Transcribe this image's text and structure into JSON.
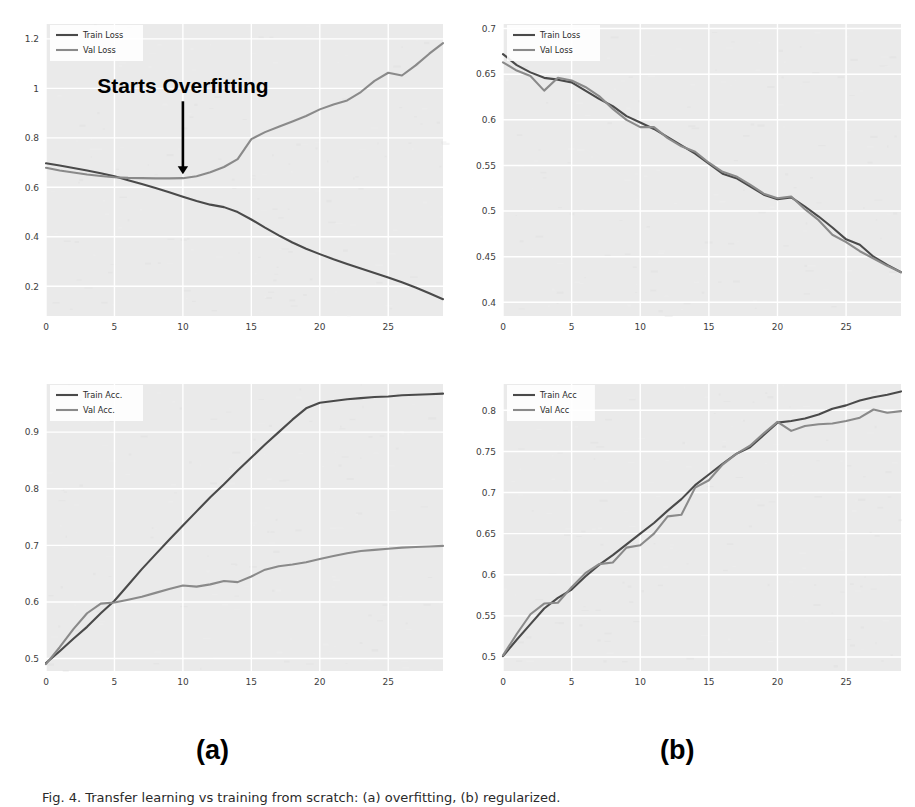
{
  "figure": {
    "panel_letters": [
      "(a)",
      "(b)"
    ],
    "caption": "Fig. 4. Transfer learning vs training from scratch: (a) overfitting, (b) regularized.",
    "colors": {
      "train": "#4a4a4a",
      "val": "#8a8a8a",
      "plot_background": "#eaeaea",
      "grid": "#ffffff",
      "text": "#2b2b2b",
      "annotation": "#000000"
    }
  },
  "chart_data": [
    {
      "id": "top-left",
      "type": "line",
      "title": "Train Loss: 0.110, Val Accuracy: 1.183",
      "xlabel": "",
      "ylabel": "",
      "xlim": [
        0,
        29
      ],
      "ylim": [
        0.08,
        1.26
      ],
      "xticks": [
        0,
        5,
        10,
        15,
        20,
        25
      ],
      "yticks": [
        0.2,
        0.4,
        0.6,
        0.8,
        1,
        1.2
      ],
      "ytick_labels": [
        "0.2",
        "0.4",
        "0.6",
        "0.8",
        "1",
        "1.2"
      ],
      "grid": true,
      "legend_position": "upper-left",
      "annotations": [
        {
          "text": "Starts Overfitting",
          "x": 10,
          "y": 0.98,
          "arrow_to_x": 10,
          "arrow_to_y": 0.645
        }
      ],
      "x": [
        0,
        1,
        2,
        3,
        4,
        5,
        6,
        7,
        8,
        9,
        10,
        11,
        12,
        13,
        14,
        15,
        16,
        17,
        18,
        19,
        20,
        21,
        22,
        23,
        24,
        25,
        26,
        27,
        28,
        29
      ],
      "series": [
        {
          "name": "Train Loss",
          "color": "#4a4a4a",
          "values": [
            0.697,
            0.688,
            0.678,
            0.668,
            0.657,
            0.645,
            0.629,
            0.613,
            0.597,
            0.58,
            0.562,
            0.545,
            0.53,
            0.52,
            0.5,
            0.47,
            0.437,
            0.406,
            0.377,
            0.352,
            0.33,
            0.309,
            0.29,
            0.272,
            0.254,
            0.236,
            0.216,
            0.195,
            0.172,
            0.148
          ]
        },
        {
          "name": "Val Loss",
          "color": "#8a8a8a",
          "values": [
            0.679,
            0.668,
            0.66,
            0.652,
            0.646,
            0.641,
            0.638,
            0.637,
            0.636,
            0.636,
            0.637,
            0.645,
            0.661,
            0.682,
            0.714,
            0.795,
            0.823,
            0.845,
            0.866,
            0.888,
            0.915,
            0.935,
            0.951,
            0.985,
            1.03,
            1.063,
            1.052,
            1.093,
            1.14,
            1.183
          ]
        }
      ]
    },
    {
      "id": "top-right",
      "type": "line",
      "title": "Train Loss: 0.398, Val Accuracy: 0.433",
      "xlabel": "",
      "ylabel": "",
      "xlim": [
        0,
        29
      ],
      "ylim": [
        0.385,
        0.705
      ],
      "xticks": [
        0,
        5,
        10,
        15,
        20,
        25
      ],
      "yticks": [
        0.4,
        0.45,
        0.5,
        0.55,
        0.6,
        0.65,
        0.7
      ],
      "ytick_labels": [
        "0.4",
        "0.45",
        "0.5",
        "0.55",
        "0.6",
        "0.65",
        "0.7"
      ],
      "grid": true,
      "legend_position": "upper-left",
      "annotations": [],
      "x": [
        0,
        1,
        2,
        3,
        4,
        5,
        6,
        7,
        8,
        9,
        10,
        11,
        12,
        13,
        14,
        15,
        16,
        17,
        18,
        19,
        20,
        21,
        22,
        23,
        24,
        25,
        26,
        27,
        28,
        29
      ],
      "series": [
        {
          "name": "Train Loss",
          "color": "#4a4a4a",
          "values": [
            0.672,
            0.66,
            0.652,
            0.646,
            0.644,
            0.641,
            0.632,
            0.623,
            0.615,
            0.604,
            0.597,
            0.59,
            0.581,
            0.572,
            0.563,
            0.552,
            0.541,
            0.536,
            0.527,
            0.518,
            0.513,
            0.515,
            0.505,
            0.494,
            0.482,
            0.469,
            0.463,
            0.45,
            0.441,
            0.433
          ]
        },
        {
          "name": "Val Loss",
          "color": "#8a8a8a",
          "values": [
            0.663,
            0.654,
            0.648,
            0.632,
            0.646,
            0.643,
            0.636,
            0.626,
            0.612,
            0.6,
            0.592,
            0.592,
            0.58,
            0.571,
            0.565,
            0.553,
            0.543,
            0.538,
            0.529,
            0.519,
            0.514,
            0.516,
            0.502,
            0.49,
            0.474,
            0.466,
            0.456,
            0.448,
            0.44,
            0.433
          ]
        }
      ]
    },
    {
      "id": "bottom-left",
      "type": "line",
      "title": "Train Accuracy: 0.968, Val Accuracy: 0.699",
      "xlabel": "",
      "ylabel": "",
      "xlim": [
        0,
        29
      ],
      "ylim": [
        0.478,
        0.985
      ],
      "xticks": [
        0,
        5,
        10,
        15,
        20,
        25
      ],
      "yticks": [
        0.5,
        0.6,
        0.7,
        0.8,
        0.9
      ],
      "ytick_labels": [
        "0.5",
        "0.6",
        "0.7",
        "0.8",
        "0.9"
      ],
      "grid": true,
      "legend_position": "upper-left",
      "annotations": [],
      "x": [
        0,
        1,
        2,
        3,
        4,
        5,
        6,
        7,
        8,
        9,
        10,
        11,
        12,
        13,
        14,
        15,
        16,
        17,
        18,
        19,
        20,
        21,
        22,
        23,
        24,
        25,
        26,
        27,
        28,
        29
      ],
      "series": [
        {
          "name": "Train Acc.",
          "color": "#4a4a4a",
          "values": [
            0.492,
            0.513,
            0.535,
            0.556,
            0.58,
            0.602,
            0.63,
            0.658,
            0.684,
            0.71,
            0.735,
            0.76,
            0.785,
            0.808,
            0.832,
            0.855,
            0.878,
            0.9,
            0.922,
            0.942,
            0.952,
            0.955,
            0.958,
            0.96,
            0.962,
            0.963,
            0.965,
            0.966,
            0.967,
            0.968
          ]
        },
        {
          "name": "Val Acc.",
          "color": "#8a8a8a",
          "values": [
            0.49,
            0.52,
            0.552,
            0.58,
            0.597,
            0.599,
            0.604,
            0.609,
            0.616,
            0.623,
            0.629,
            0.627,
            0.631,
            0.637,
            0.635,
            0.645,
            0.657,
            0.663,
            0.666,
            0.67,
            0.676,
            0.681,
            0.686,
            0.69,
            0.692,
            0.694,
            0.696,
            0.697,
            0.698,
            0.699
          ]
        }
      ]
    },
    {
      "id": "bottom-right",
      "type": "line",
      "title": "Train Accuracy: 0.823, Val Accuracy: 0.799",
      "xlabel": "",
      "ylabel": "",
      "xlim": [
        0,
        29
      ],
      "ylim": [
        0.483,
        0.832
      ],
      "xticks": [
        0,
        5,
        10,
        15,
        20,
        25
      ],
      "yticks": [
        0.5,
        0.55,
        0.6,
        0.65,
        0.7,
        0.75,
        0.8
      ],
      "ytick_labels": [
        "0.5",
        "0.55",
        "0.6",
        "0.65",
        "0.7",
        "0.75",
        "0.8"
      ],
      "grid": true,
      "legend_position": "upper-left",
      "annotations": [],
      "x": [
        0,
        1,
        2,
        3,
        4,
        5,
        6,
        7,
        8,
        9,
        10,
        11,
        12,
        13,
        14,
        15,
        16,
        17,
        18,
        19,
        20,
        21,
        22,
        23,
        24,
        25,
        26,
        27,
        28,
        29
      ],
      "series": [
        {
          "name": "Train Acc",
          "color": "#4a4a4a",
          "values": [
            0.501,
            0.521,
            0.54,
            0.559,
            0.572,
            0.582,
            0.598,
            0.612,
            0.624,
            0.637,
            0.65,
            0.663,
            0.678,
            0.692,
            0.709,
            0.722,
            0.735,
            0.747,
            0.755,
            0.77,
            0.785,
            0.787,
            0.79,
            0.795,
            0.802,
            0.806,
            0.812,
            0.816,
            0.819,
            0.823
          ]
        },
        {
          "name": "Val Acc",
          "color": "#8a8a8a",
          "values": [
            0.502,
            0.528,
            0.552,
            0.565,
            0.566,
            0.585,
            0.602,
            0.613,
            0.615,
            0.633,
            0.636,
            0.65,
            0.671,
            0.673,
            0.706,
            0.715,
            0.734,
            0.747,
            0.757,
            0.772,
            0.786,
            0.775,
            0.781,
            0.783,
            0.784,
            0.787,
            0.791,
            0.801,
            0.797,
            0.799
          ]
        }
      ]
    }
  ]
}
